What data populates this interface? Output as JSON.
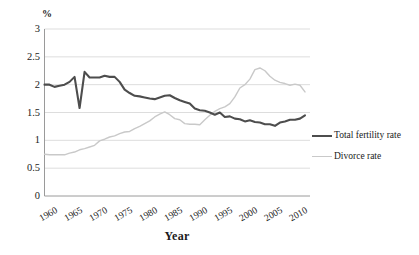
{
  "chart_data": {
    "type": "line",
    "title": "",
    "xlabel": "Year",
    "ylabel": "%",
    "xlim": [
      1959,
      2012
    ],
    "ylim": [
      0,
      3
    ],
    "ytick_labels": [
      "3",
      "2.5",
      "2",
      "1.5",
      "1",
      "0.5",
      "0"
    ],
    "ytick_values": [
      3,
      2.5,
      2,
      1.5,
      1,
      0.5,
      0
    ],
    "xtick_labels": [
      "1960",
      "1965",
      "1970",
      "1975",
      "1980",
      "1985",
      "1990",
      "1995",
      "2000",
      "2005",
      "2010"
    ],
    "xtick_values": [
      1960,
      1965,
      1970,
      1975,
      1980,
      1985,
      1990,
      1995,
      2000,
      2005,
      2010
    ],
    "grid": "horizontal",
    "legend_position": "right",
    "series": [
      {
        "name": "Total fertility rate",
        "color": "#4d4d4d",
        "width": 2.1,
        "x": [
          1959,
          1960,
          1961,
          1962,
          1963,
          1964,
          1965,
          1966,
          1967,
          1968,
          1969,
          1970,
          1971,
          1972,
          1973,
          1974,
          1975,
          1976,
          1977,
          1978,
          1979,
          1980,
          1981,
          1982,
          1983,
          1984,
          1985,
          1986,
          1987,
          1988,
          1989,
          1990,
          1991,
          1992,
          1993,
          1994,
          1995,
          1996,
          1997,
          1998,
          1999,
          2000,
          2001,
          2002,
          2003,
          2004,
          2005,
          2006,
          2007,
          2008,
          2009,
          2010,
          2011
        ],
        "values": [
          2.0,
          2.0,
          1.96,
          1.98,
          2.0,
          2.05,
          2.14,
          1.58,
          2.23,
          2.13,
          2.13,
          2.13,
          2.16,
          2.14,
          2.14,
          2.05,
          1.91,
          1.85,
          1.8,
          1.79,
          1.77,
          1.75,
          1.74,
          1.77,
          1.8,
          1.81,
          1.76,
          1.72,
          1.69,
          1.66,
          1.57,
          1.54,
          1.53,
          1.5,
          1.46,
          1.5,
          1.42,
          1.43,
          1.39,
          1.38,
          1.34,
          1.36,
          1.33,
          1.32,
          1.29,
          1.29,
          1.26,
          1.32,
          1.34,
          1.37,
          1.37,
          1.39,
          1.45
        ]
      },
      {
        "name": "Divorce rate",
        "color": "#c9c9c9",
        "width": 1.4,
        "x": [
          1959,
          1960,
          1961,
          1962,
          1963,
          1964,
          1965,
          1966,
          1967,
          1968,
          1969,
          1970,
          1971,
          1972,
          1973,
          1974,
          1975,
          1976,
          1977,
          1978,
          1979,
          1980,
          1981,
          1982,
          1983,
          1984,
          1985,
          1986,
          1987,
          1988,
          1989,
          1990,
          1991,
          1992,
          1993,
          1994,
          1995,
          1996,
          1997,
          1998,
          1999,
          2000,
          2001,
          2002,
          2003,
          2004,
          2005,
          2006,
          2007,
          2008,
          2009,
          2010,
          2011
        ],
        "values": [
          0.75,
          0.74,
          0.74,
          0.74,
          0.74,
          0.77,
          0.79,
          0.83,
          0.85,
          0.88,
          0.91,
          0.99,
          1.02,
          1.06,
          1.08,
          1.12,
          1.15,
          1.16,
          1.21,
          1.25,
          1.3,
          1.35,
          1.42,
          1.47,
          1.51,
          1.46,
          1.39,
          1.37,
          1.3,
          1.29,
          1.29,
          1.28,
          1.37,
          1.45,
          1.52,
          1.57,
          1.6,
          1.66,
          1.78,
          1.94,
          2.0,
          2.1,
          2.27,
          2.3,
          2.25,
          2.15,
          2.08,
          2.04,
          2.02,
          1.99,
          2.01,
          1.99,
          1.87
        ]
      }
    ]
  },
  "legend": {
    "items": [
      {
        "label": "Total fertility rate",
        "color": "#4d4d4d"
      },
      {
        "label": "Divorce rate",
        "color": "#c9c9c9"
      }
    ]
  }
}
